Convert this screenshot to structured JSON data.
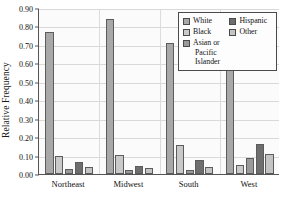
{
  "chart_data": {
    "type": "bar",
    "title": "",
    "xlabel": "",
    "ylabel": "Relative Frequency",
    "categories": [
      "Northeast",
      "Midwest",
      "South",
      "West"
    ],
    "ylim": [
      0.0,
      0.9
    ],
    "ytick_labels": [
      "0.00",
      "0.10",
      "0.20",
      "0.30",
      "0.40",
      "0.50",
      "0.60",
      "0.70",
      "0.80",
      "0.90"
    ],
    "ytick_values": [
      0.0,
      0.1,
      0.2,
      0.3,
      0.4,
      0.5,
      0.6,
      0.7,
      0.8,
      0.9
    ],
    "grid": "horizontal",
    "legend_position": "top-right-inside",
    "series": [
      {
        "name": "White",
        "color": "#a8a8a8",
        "values": [
          0.77,
          0.84,
          0.71,
          0.65
        ]
      },
      {
        "name": "Black",
        "color": "#c9c9c9",
        "values": [
          0.1,
          0.105,
          0.16,
          0.05
        ]
      },
      {
        "name": "Asian or Pacific Islander",
        "color": "#9a9a9a",
        "values": [
          0.025,
          0.022,
          0.022,
          0.085
        ]
      },
      {
        "name": "Hispanic",
        "color": "#6e6e6e",
        "values": [
          0.065,
          0.042,
          0.078,
          0.162
        ]
      },
      {
        "name": "Other",
        "color": "#c4c4c4",
        "values": [
          0.04,
          0.03,
          0.04,
          0.11
        ]
      }
    ]
  },
  "legend": {
    "column1": [
      {
        "label": "White",
        "color": "#a8a8a8"
      },
      {
        "label": "Black",
        "color": "#c9c9c9"
      },
      {
        "label_line1": "Asian or",
        "label_line2": "Pacific Islander",
        "color": "#9a9a9a"
      }
    ],
    "column2": [
      {
        "label": "Hispanic",
        "color": "#6e6e6e"
      },
      {
        "label": "Other",
        "color": "#c4c4c4"
      }
    ]
  }
}
